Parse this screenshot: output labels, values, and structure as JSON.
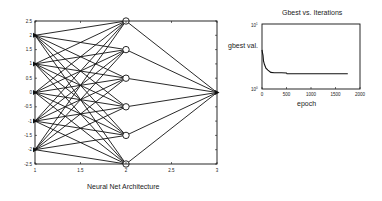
{
  "figure": {
    "background": "#ffffff",
    "line_color": "#111111"
  },
  "chart_data": [
    {
      "type": "diagram-plot",
      "title": "Neural Net Architecture",
      "xlabel": "",
      "ylabel": "",
      "xlim": [
        1,
        3
      ],
      "ylim": [
        -2.5,
        2.5
      ],
      "grid": false,
      "x_ticks": [
        "1",
        "1.5",
        "2",
        "2.5",
        "3"
      ],
      "y_ticks": [
        "2.5",
        "2",
        "1.5",
        "1",
        "0.5",
        "0",
        "-0.5",
        "-1",
        "-1.5",
        "-2",
        "-2.5"
      ],
      "layers": [
        {
          "name": "input",
          "x": 1,
          "nodes_y": [
            2,
            1,
            0,
            -1,
            -2
          ],
          "marker": "triangle-right"
        },
        {
          "name": "hidden",
          "x": 2,
          "nodes_y": [
            2.5,
            1.5,
            0.5,
            -0.5,
            -1.5,
            -2.5
          ],
          "marker": "circle"
        },
        {
          "name": "output",
          "x": 3,
          "nodes_y": [
            0
          ],
          "marker": "triangle-right"
        }
      ],
      "connections": "fully-connected between consecutive layers"
    },
    {
      "type": "line",
      "title": "Gbest vs. Iterations",
      "xlabel": "epoch",
      "ylabel": "gbest val.",
      "xlim": [
        0,
        2000
      ],
      "ylim": [
        1,
        10
      ],
      "yscale": "log",
      "grid": false,
      "x_ticks": [
        "0",
        "500",
        "1000",
        "1500",
        "2000"
      ],
      "y_ticks": [
        "10^1",
        "10^0"
      ],
      "series": [
        {
          "name": "gbest",
          "x": [
            0,
            10,
            20,
            30,
            50,
            80,
            120,
            180,
            250,
            400,
            500,
            510,
            1000,
            1500,
            1750
          ],
          "values": [
            4.0,
            3.6,
            3.3,
            2.7,
            2.4,
            2.1,
            1.95,
            1.8,
            1.78,
            1.78,
            1.76,
            1.72,
            1.72,
            1.72,
            1.72
          ]
        }
      ]
    }
  ],
  "labels": {
    "left_title": "Neural Net Architecture",
    "right_title": "Gbest vs. Iterations",
    "right_xlabel": "epoch",
    "right_ylabel": "gbest val.",
    "right_ytick_top_base": "10",
    "right_ytick_top_exp": "1",
    "right_ytick_bottom_base": "10",
    "right_ytick_bottom_exp": "0",
    "left_xticks": [
      "1",
      "1.5",
      "2",
      "2.5",
      "3"
    ],
    "left_yticks": [
      "2.5",
      "2",
      "1.5",
      "1",
      "0.5",
      "0",
      "-0.5",
      "-1",
      "-1.5",
      "-2",
      "-2.5"
    ],
    "right_xticks": [
      "0",
      "500",
      "1000",
      "1500",
      "2000"
    ]
  }
}
